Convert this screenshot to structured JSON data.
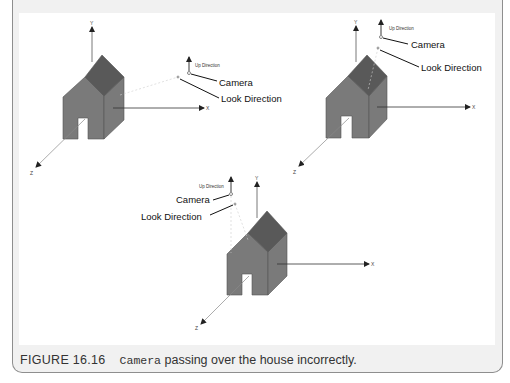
{
  "figure": {
    "number": "FIGURE 16.16",
    "caption_code": "Camera",
    "caption_text": " passing over the house incorrectly."
  },
  "labels": {
    "camera": "Camera",
    "look_direction": "Look Direction",
    "up_direction": "Up Direction",
    "axis_x": "X",
    "axis_y": "Y",
    "axis_z": "Z"
  },
  "colors": {
    "roof": "#595959",
    "wall": "#7a7a7a",
    "frame_bg": "#f1f1f1",
    "frame_border": "#8e8e8e"
  },
  "scenes": [
    {
      "name": "scene-1",
      "position": "top-left"
    },
    {
      "name": "scene-2",
      "position": "top-right"
    },
    {
      "name": "scene-3",
      "position": "bottom-center"
    }
  ]
}
